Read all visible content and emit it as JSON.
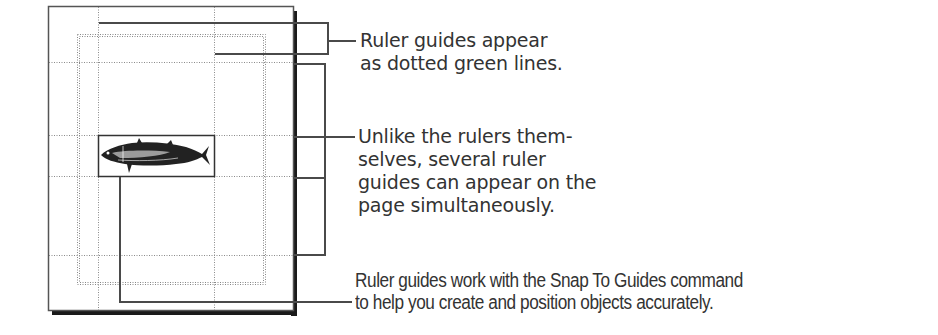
{
  "callouts": [
    {
      "id": "ruler-guides-appearance",
      "lines": [
        "Ruler guides appear",
        "as dotted green lines."
      ]
    },
    {
      "id": "multiple-guides",
      "lines": [
        "Unlike the rulers them-",
        "selves, several ruler",
        "guides can appear on the",
        "page simultaneously."
      ]
    },
    {
      "id": "snap-to-guides",
      "lines": [
        "Ruler guides work with the Snap To Guides command",
        "to help you create and position objects accurately."
      ]
    }
  ],
  "page": {
    "image_icon": "fish-illustration",
    "guide_style": "dotted",
    "colors": {
      "border": "#555555",
      "shadow": "#1a1a1a",
      "guide": "#8a8a8a",
      "leader": "#4a4a4a"
    }
  }
}
